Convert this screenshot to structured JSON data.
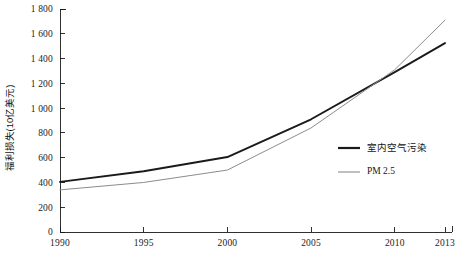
{
  "chart_data": {
    "type": "line",
    "title": "",
    "xlabel": "",
    "ylabel": "福利损失(10亿美元)",
    "x": [
      1990,
      1995,
      2000,
      2005,
      2010,
      2013
    ],
    "xlim": [
      1990,
      2013
    ],
    "ylim": [
      0,
      1800
    ],
    "grid": false,
    "legend_position": "right-middle",
    "x_tick_labels": [
      "1990",
      "1995",
      "2000",
      "2005",
      "2010",
      "2013"
    ],
    "y_tick_labels": [
      "0",
      "200",
      "400",
      "600",
      "800",
      "1 000",
      "1 200",
      "1 400",
      "1 600",
      "1 800"
    ],
    "y_ticks": [
      0,
      200,
      400,
      600,
      800,
      1000,
      1200,
      1400,
      1600,
      1800
    ],
    "series": [
      {
        "name": "室内空气污染",
        "color": "#1a1a1a",
        "width": 1.9,
        "values": [
          405,
          490,
          605,
          910,
          1290,
          1525
        ]
      },
      {
        "name": "PM 2.5",
        "color": "#8c8c8c",
        "width": 1.0,
        "values": [
          340,
          400,
          500,
          840,
          1310,
          1710
        ]
      }
    ]
  },
  "legend": {
    "items": [
      {
        "label": "室内空气污染",
        "color": "#1a1a1a",
        "width": 2.2
      },
      {
        "label": "PM 2.5",
        "color": "#8c8c8c",
        "width": 1.1
      }
    ]
  },
  "colors": {
    "indoor_air_pollution": "#1a1a1a",
    "pm25": "#8c8c8c",
    "axis": "#1a1a1a",
    "background": "#ffffff"
  }
}
